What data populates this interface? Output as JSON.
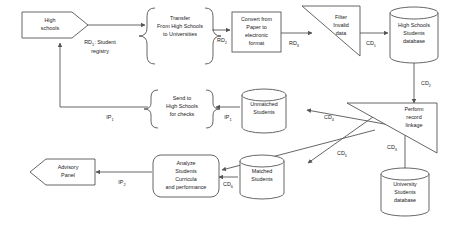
{
  "diagram": {
    "background_color": "#ffffff",
    "stroke_color": "#555555",
    "text_color": "#1a1a1a",
    "nodes": [
      {
        "id": "high-schools",
        "shape": "pentagon-right",
        "lines": [
          "High",
          "schools"
        ]
      },
      {
        "id": "transfer-process",
        "shape": "rounded-brace-box",
        "lines": [
          "Transfer",
          "From High Schools",
          "to Universities"
        ]
      },
      {
        "id": "convert-process",
        "shape": "rectangle",
        "lines": [
          "Convert from",
          "Paper to",
          "electronic",
          "format"
        ]
      },
      {
        "id": "filter-process",
        "shape": "triangle-right",
        "lines": [
          "Filter",
          "Invalid",
          "data"
        ]
      },
      {
        "id": "high-schools-db",
        "shape": "cylinder",
        "lines": [
          "High Schools",
          "Students",
          "database"
        ]
      },
      {
        "id": "record-linkage-process",
        "shape": "triangle-left",
        "lines": [
          "Perform",
          "record",
          "linkage"
        ]
      },
      {
        "id": "university-db",
        "shape": "cylinder",
        "lines": [
          "University",
          "Students",
          "database"
        ]
      },
      {
        "id": "unmatched-students-db",
        "shape": "cylinder",
        "lines": [
          "Unmatched",
          "Students"
        ]
      },
      {
        "id": "matched-students-db",
        "shape": "cylinder",
        "lines": [
          "Matched",
          "Students"
        ]
      },
      {
        "id": "send-checks-process",
        "shape": "rounded-brace-box",
        "lines": [
          "Send to",
          "High Schools",
          "for checks"
        ]
      },
      {
        "id": "analyze-process",
        "shape": "rounded-box",
        "lines": [
          "Analyze",
          "Students",
          "Curricula",
          "and performance"
        ]
      },
      {
        "id": "advisory-panel",
        "shape": "pentagon-left",
        "lines": [
          "Advisory",
          "Panel"
        ]
      }
    ],
    "edge_labels": [
      {
        "id": "rd1",
        "base": "RD",
        "sub": "1",
        "suffix": ": Student",
        "line2": "registry"
      },
      {
        "id": "rd2",
        "base": "RD",
        "sub": "2",
        "suffix": ""
      },
      {
        "id": "rd3",
        "base": "RD",
        "sub": "3",
        "suffix": ""
      },
      {
        "id": "cd1",
        "base": "CD",
        "sub": "1",
        "suffix": ""
      },
      {
        "id": "cd2",
        "base": "CD",
        "sub": "2",
        "suffix": ""
      },
      {
        "id": "cd3",
        "base": "CD",
        "sub": "3",
        "suffix": ""
      },
      {
        "id": "cd4",
        "base": "CD",
        "sub": "4",
        "suffix": ""
      },
      {
        "id": "cd5",
        "base": "CD",
        "sub": "5",
        "suffix": ""
      },
      {
        "id": "cd6",
        "base": "CD",
        "sub": "6",
        "suffix": ""
      },
      {
        "id": "ip1a",
        "base": "IP",
        "sub": "1",
        "suffix": ""
      },
      {
        "id": "ip1b",
        "base": "IP",
        "sub": "1",
        "suffix": ""
      },
      {
        "id": "ip2",
        "base": "IP",
        "sub": "2",
        "suffix": ""
      }
    ]
  }
}
